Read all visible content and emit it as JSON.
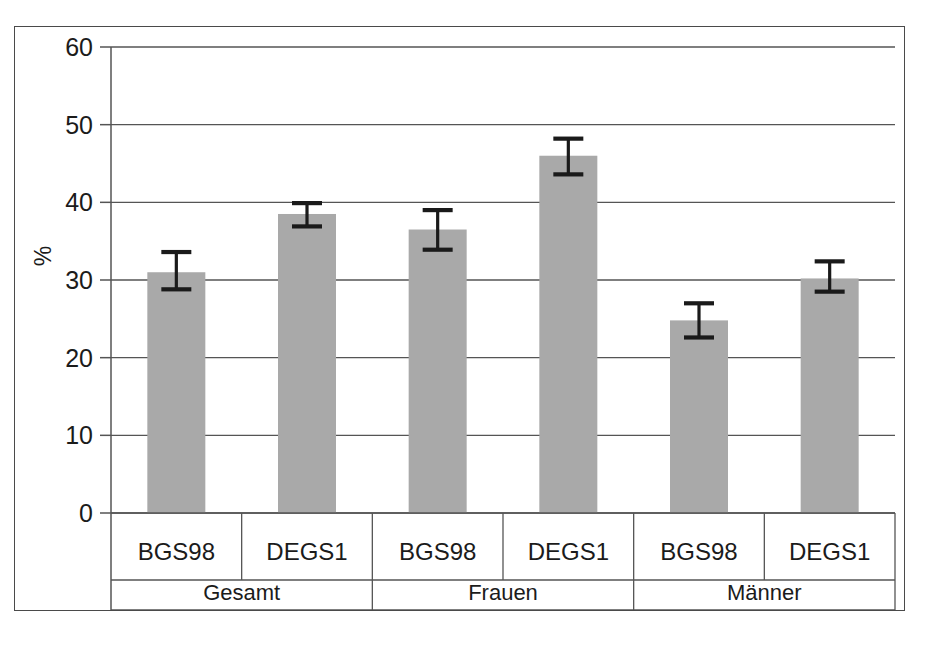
{
  "chart_data": {
    "type": "bar",
    "title": "",
    "subtitle": "",
    "xlabel": "",
    "ylabel": "%",
    "ylim": [
      0,
      60
    ],
    "yticks": [
      0,
      10,
      20,
      30,
      40,
      50,
      60
    ],
    "ytick_labels": [
      "0",
      "10",
      "20",
      "30",
      "40",
      "50",
      "60"
    ],
    "grid": true,
    "legend": "none",
    "orientation": "vertical",
    "bar_color": "#a9a9a9",
    "error_bar_color": "#1a1a1a",
    "categories": [
      "BGS98",
      "DEGS1",
      "BGS98",
      "DEGS1",
      "BGS98",
      "DEGS1"
    ],
    "groups": [
      {
        "label": "Gesamt",
        "categories": [
          "BGS98",
          "DEGS1"
        ]
      },
      {
        "label": "Frauen",
        "categories": [
          "BGS98",
          "DEGS1"
        ]
      },
      {
        "label": "Männer",
        "categories": [
          "BGS98",
          "DEGS1"
        ]
      }
    ],
    "values": [
      31.0,
      38.5,
      36.5,
      46.0,
      24.8,
      30.2
    ],
    "error_low": [
      28.8,
      36.9,
      33.9,
      43.6,
      22.6,
      28.5
    ],
    "error_high": [
      33.6,
      39.9,
      39.0,
      48.2,
      27.0,
      32.4
    ],
    "bars": [
      {
        "group": "Gesamt",
        "survey": "BGS98",
        "value": 31.0,
        "ci_low": 28.8,
        "ci_high": 33.6
      },
      {
        "group": "Gesamt",
        "survey": "DEGS1",
        "value": 38.5,
        "ci_low": 36.9,
        "ci_high": 39.9
      },
      {
        "group": "Frauen",
        "survey": "BGS98",
        "value": 36.5,
        "ci_low": 33.9,
        "ci_high": 39.0
      },
      {
        "group": "Frauen",
        "survey": "DEGS1",
        "value": 46.0,
        "ci_low": 43.6,
        "ci_high": 48.2
      },
      {
        "group": "Männer",
        "survey": "BGS98",
        "value": 24.8,
        "ci_low": 22.6,
        "ci_high": 27.0
      },
      {
        "group": "Männer",
        "survey": "DEGS1",
        "value": 30.2,
        "ci_low": 28.5,
        "ci_high": 32.4
      }
    ]
  }
}
